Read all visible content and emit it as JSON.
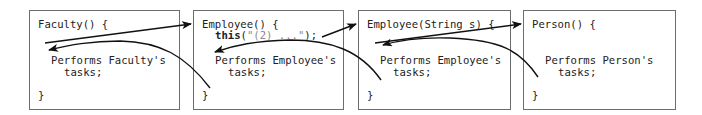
{
  "boxes": [
    {
      "header": "Faculty() {",
      "body_line1": "Performs Faculty's",
      "body_line2": "tasks;",
      "close": "}"
    },
    {
      "header": "Employee() {",
      "call_keyword": "this",
      "call_open": "(",
      "call_string": "\"(2) ...\"",
      "call_close": ");",
      "body_line1": "Performs Employee's",
      "body_line2": "tasks;",
      "close": "}"
    },
    {
      "header": "Employee(String s) {",
      "body_line1": "Performs Employee's",
      "body_line2": "tasks;",
      "close": "}"
    },
    {
      "header": "Person() {",
      "body_line1": "Performs Person's",
      "body_line2": "tasks;",
      "close": "}"
    }
  ],
  "colors": {
    "border": "#6d6d6d",
    "arrow": "#111111",
    "string": "#8a8a8a"
  }
}
